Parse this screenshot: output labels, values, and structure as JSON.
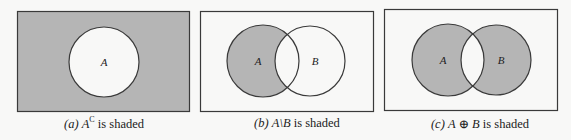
{
  "figure": {
    "colors": {
      "background": "#f8f8f7",
      "shade": "#b5b5b5",
      "stroke": "#3a3a3a",
      "unshaded": "#f8f8f7"
    },
    "panels": [
      {
        "id": "a",
        "caption_prefix": "(a)",
        "caption_set": "A",
        "caption_sup": "C",
        "caption_suffix": "is shaded",
        "shaded_region": "complement of A",
        "sets": [
          {
            "label": "A"
          }
        ]
      },
      {
        "id": "b",
        "caption_prefix": "(b)",
        "caption_set": "A\\B",
        "caption_suffix": "is shaded",
        "shaded_region": "A minus B",
        "sets": [
          {
            "label": "A"
          },
          {
            "label": "B"
          }
        ]
      },
      {
        "id": "c",
        "caption_prefix": "(c)",
        "caption_set": "A ⊕ B",
        "caption_suffix": "is shaded",
        "shaded_region": "symmetric difference of A and B",
        "sets": [
          {
            "label": "A"
          },
          {
            "label": "B"
          }
        ]
      }
    ]
  }
}
